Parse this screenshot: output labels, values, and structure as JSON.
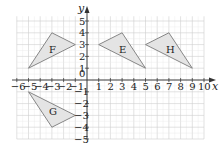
{
  "diagram": {
    "type": "coordinate-grid",
    "axes": {
      "x_label": "x",
      "y_label": "y",
      "origin_label": "0",
      "x_range": [
        -6,
        10
      ],
      "y_range": [
        -5,
        5
      ],
      "x_ticks": [
        "-6",
        "-5",
        "-4",
        "-3",
        "-2",
        "-1",
        "1",
        "2",
        "3",
        "4",
        "5",
        "6",
        "7",
        "8",
        "9",
        "10"
      ],
      "y_ticks": [
        "5",
        "4",
        "3",
        "2",
        "1",
        "-1",
        "-2",
        "-3",
        "-4",
        "-5"
      ]
    },
    "shapes": [
      {
        "label": "F",
        "vertices": [
          [
            -5,
            1
          ],
          [
            -3,
            4
          ],
          [
            -1,
            3
          ]
        ]
      },
      {
        "label": "E",
        "vertices": [
          [
            1,
            3
          ],
          [
            3,
            4
          ],
          [
            5,
            1
          ]
        ]
      },
      {
        "label": "H",
        "vertices": [
          [
            5,
            3
          ],
          [
            7,
            4
          ],
          [
            9,
            1
          ]
        ]
      },
      {
        "label": "G",
        "vertices": [
          [
            -5,
            -1
          ],
          [
            -3,
            -4
          ],
          [
            -1,
            -3
          ]
        ]
      }
    ],
    "colors": {
      "grid_major": "#cfcfcf",
      "grid_minor": "#e8e8e8",
      "axis": "#333333",
      "shape_fill": "#e4e4e4",
      "shape_stroke": "#7a7a7a"
    }
  }
}
